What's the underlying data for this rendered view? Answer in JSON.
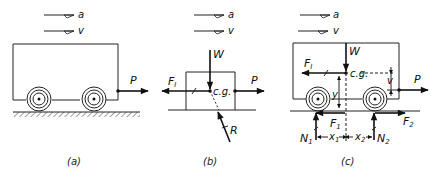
{
  "panels": [
    {
      "id": "a",
      "caption": "(a)",
      "labels": {
        "accel": "a",
        "velocity": "v",
        "pull": "P"
      }
    },
    {
      "id": "b",
      "caption": "(b)",
      "labels": {
        "accel": "a",
        "velocity": "v",
        "weight": "W",
        "inertia": "F",
        "inertia_sub": "I",
        "cg": "c.g.",
        "pull": "P",
        "reaction": "R"
      }
    },
    {
      "id": "c",
      "caption": "(c)",
      "labels": {
        "accel": "a",
        "velocity": "v",
        "weight": "W",
        "inertia": "F",
        "inertia_sub": "I",
        "cg": "c.g.",
        "height_v": "v",
        "height_y": "y",
        "pull": "P",
        "f1": "F",
        "f1_sub": "1",
        "f2": "F",
        "f2_sub": "2",
        "n1": "N",
        "n1_sub": "1",
        "n2": "N",
        "n2_sub": "2",
        "x1": "x",
        "x1_sub": "1",
        "x2": "x",
        "x2_sub": "2"
      }
    }
  ],
  "colors": {
    "ink": "#111111",
    "background": "#ffffff"
  }
}
